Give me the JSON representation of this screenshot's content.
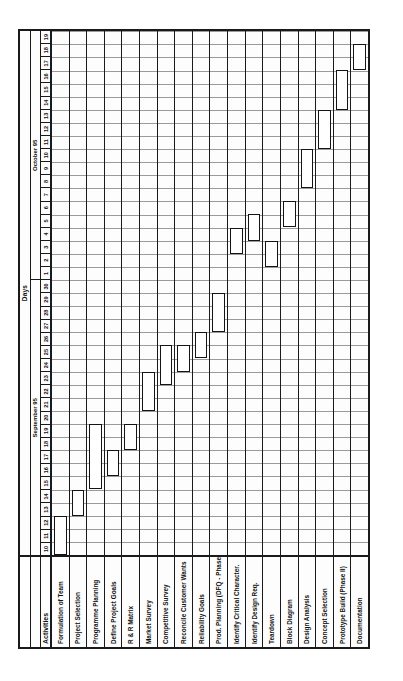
{
  "chart_data": {
    "type": "bar",
    "subtype": "gantt",
    "title": "Days",
    "xlabel": "Days",
    "ylabel": "Activities",
    "grid": true,
    "legend": "none",
    "orientation": "rotated-90-ccw",
    "axis_label_activities": "Activities",
    "months": [
      {
        "label": "September 95",
        "days": [
          "10",
          "11",
          "12",
          "13",
          "14",
          "15",
          "16",
          "17",
          "18",
          "19",
          "20",
          "21",
          "22",
          "23",
          "24",
          "25",
          "26",
          "27",
          "28",
          "29",
          "30"
        ]
      },
      {
        "label": "October 95",
        "days": [
          "1",
          "2",
          "3",
          "4",
          "5",
          "6",
          "7",
          "8",
          "9",
          "10",
          "11",
          "12",
          "13",
          "14",
          "15",
          "16",
          "17",
          "18",
          "19"
        ]
      }
    ],
    "day_ticks": [
      "10",
      "11",
      "12",
      "13",
      "14",
      "15",
      "16",
      "17",
      "18",
      "19",
      "20",
      "21",
      "22",
      "23",
      "24",
      "25",
      "26",
      "27",
      "28",
      "29",
      "30",
      "1",
      "2",
      "3",
      "4",
      "5",
      "6",
      "7",
      "8",
      "9",
      "10",
      "11",
      "12",
      "13",
      "14",
      "15",
      "16",
      "17",
      "18",
      "19"
    ],
    "xlim": [
      "September 10 1995",
      "October 19 1995"
    ],
    "categories": [
      "Formulation of Team",
      "Project Selection",
      "Programme Planning",
      "Define Project Goals",
      "R & R Matrix",
      "Market Survey",
      "Competitive Survey",
      "Reconcile Customer Wants",
      "Reliability Goals",
      "Prod. Planning (DFQ - Phase I)",
      "Identify Critical Character.",
      "Identify Design Req.",
      "Teardown",
      "Block Diagram",
      "Design Analysis",
      "Concept Selection",
      "Prototype Build (Phase II)",
      "Documentation"
    ],
    "tasks": [
      {
        "name": "Formulation of Team",
        "start_index": 0,
        "end_index": 3,
        "start_day": "Sep 10",
        "end_day": "Sep 12",
        "duration": 3
      },
      {
        "name": "Project Selection",
        "start_index": 3,
        "end_index": 5,
        "start_day": "Sep 13",
        "end_day": "Sep 14",
        "duration": 2
      },
      {
        "name": "Programme Planning",
        "start_index": 5,
        "end_index": 10,
        "start_day": "Sep 15",
        "end_day": "Sep 19",
        "duration": 5
      },
      {
        "name": "Define Project Goals",
        "start_index": 6,
        "end_index": 8,
        "start_day": "Sep 16",
        "end_day": "Sep 17",
        "duration": 2
      },
      {
        "name": "R & R Matrix",
        "start_index": 8,
        "end_index": 10,
        "start_day": "Sep 18",
        "end_day": "Sep 19",
        "duration": 2
      },
      {
        "name": "Market Survey",
        "start_index": 11,
        "end_index": 14,
        "start_day": "Sep 21",
        "end_day": "Sep 23",
        "duration": 3
      },
      {
        "name": "Competitive Survey",
        "start_index": 13,
        "end_index": 16,
        "start_day": "Sep 23",
        "end_day": "Sep 25",
        "duration": 3
      },
      {
        "name": "Reconcile Customer Wants",
        "start_index": 14,
        "end_index": 16,
        "start_day": "Sep 24",
        "end_day": "Sep 25",
        "duration": 2
      },
      {
        "name": "Reliability Goals",
        "start_index": 15,
        "end_index": 17,
        "start_day": "Sep 25",
        "end_day": "Sep 26",
        "duration": 2
      },
      {
        "name": "Prod. Planning (DFQ - Phase I)",
        "start_index": 17,
        "end_index": 20,
        "start_day": "Sep 27",
        "end_day": "Sep 29",
        "duration": 3
      },
      {
        "name": "Identify Critical Character.",
        "start_index": 23,
        "end_index": 25,
        "start_day": "Oct 3",
        "end_day": "Oct 4",
        "duration": 2
      },
      {
        "name": "Identify Design Req.",
        "start_index": 24,
        "end_index": 26,
        "start_day": "Oct 4",
        "end_day": "Oct 5",
        "duration": 2
      },
      {
        "name": "Teardown",
        "start_index": 22,
        "end_index": 24,
        "start_day": "Oct 2",
        "end_day": "Oct 3",
        "duration": 2
      },
      {
        "name": "Block Diagram",
        "start_index": 25,
        "end_index": 27,
        "start_day": "Oct 5",
        "end_day": "Oct 6",
        "duration": 2
      },
      {
        "name": "Design Analysis",
        "start_index": 28,
        "end_index": 31,
        "start_day": "Oct 8",
        "end_day": "Oct 10",
        "duration": 3
      },
      {
        "name": "Concept Selection",
        "start_index": 31,
        "end_index": 34,
        "start_day": "Oct 11",
        "end_day": "Oct 13",
        "duration": 3
      },
      {
        "name": "Prototype Build (Phase II)",
        "start_index": 34,
        "end_index": 37,
        "start_day": "Oct 14",
        "end_day": "Oct 16",
        "duration": 3
      },
      {
        "name": "Documentation",
        "start_index": 37,
        "end_index": 39,
        "start_day": "Oct 17",
        "end_day": "Oct 18",
        "duration": 2
      }
    ],
    "colors": {
      "bar_fill": "#ffffff",
      "bar_border": "#141414",
      "grid_line": "#9a9a9a",
      "frame": "#1a1a1a",
      "background": "#fdfdfd",
      "text": "#111111"
    }
  }
}
